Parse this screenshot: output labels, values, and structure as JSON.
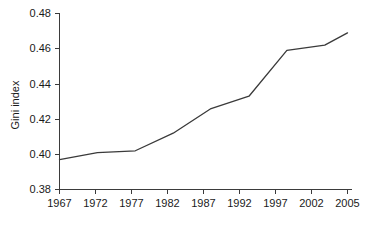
{
  "chart_data": {
    "type": "line",
    "title": "",
    "xlabel": "",
    "ylabel": "Gini index",
    "x": [
      1967,
      1972,
      1977,
      1982,
      1987,
      1992,
      1997,
      2002,
      2005
    ],
    "categories": [
      "1967",
      "1972",
      "1977",
      "1982",
      "1987",
      "1992",
      "1997",
      "2002",
      "2005"
    ],
    "values": [
      0.397,
      0.401,
      0.402,
      0.412,
      0.426,
      0.433,
      0.459,
      0.462,
      0.469
    ],
    "series": [
      {
        "name": "Gini index",
        "values": [
          0.397,
          0.401,
          0.402,
          0.412,
          0.426,
          0.433,
          0.459,
          0.462,
          0.469
        ]
      }
    ],
    "ylim": [
      0.38,
      0.48
    ],
    "yticks": [
      0.38,
      0.4,
      0.42,
      0.44,
      0.46,
      0.48
    ],
    "ytick_labels": [
      "0.38",
      "0.40",
      "0.42",
      "0.44",
      "0.46",
      "0.48"
    ],
    "xtick_labels": [
      "1967",
      "1972",
      "1977",
      "1982",
      "1987",
      "1992",
      "1997",
      "2002",
      "2005"
    ],
    "grid": false,
    "legend": false,
    "legend_position": "none",
    "line_color": "#3a3a3a",
    "axis_color": "#3b3b3b",
    "background_color": "#ffffff"
  }
}
